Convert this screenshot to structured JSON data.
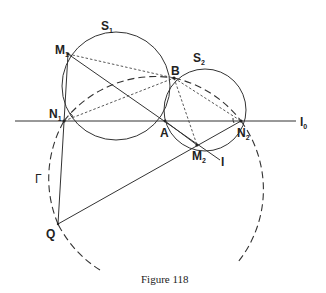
{
  "figure": {
    "caption": "Figure 118",
    "labels": {
      "S1": {
        "main": "S",
        "sub": "1"
      },
      "S2": {
        "main": "S",
        "sub": "2"
      },
      "M1": {
        "main": "M",
        "sub": "1"
      },
      "M2": {
        "main": "M",
        "sub": "2"
      },
      "N1": {
        "main": "N",
        "sub": "1"
      },
      "N2": {
        "main": "N",
        "sub": "2"
      },
      "A": {
        "main": "A"
      },
      "B": {
        "main": "B"
      },
      "Q": {
        "main": "Q"
      },
      "Gamma": {
        "main": "Γ"
      },
      "l": {
        "main": "l"
      },
      "l0": {
        "main": "l",
        "sub": "0"
      }
    },
    "points": {
      "M1": [
        68,
        54
      ],
      "N1": [
        64,
        121
      ],
      "A": [
        165,
        121
      ],
      "B": [
        174,
        78
      ],
      "N2": [
        241,
        121
      ],
      "M2": [
        197,
        145
      ],
      "Q": [
        58,
        224
      ]
    },
    "circles": {
      "S1": {
        "cx": 116,
        "cy": 86,
        "r": 54
      },
      "S2": {
        "cx": 205,
        "cy": 110,
        "r": 41
      },
      "Gamma": {
        "cx": 155,
        "cy": 182,
        "r": 116
      }
    },
    "colors": {
      "ink": "#333333",
      "background": "#ffffff"
    }
  }
}
